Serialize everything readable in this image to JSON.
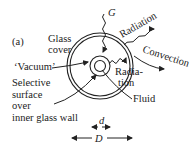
{
  "figure": {
    "panel_label": "(a)",
    "labels": {
      "G": "G",
      "radiation_out": "Radiation",
      "convection": "Convection",
      "glass_cover_1": "Glass",
      "glass_cover_2": "cover",
      "vacuum": "‘Vacuum’",
      "selective_1": "Selective",
      "selective_2": "surface",
      "selective_3": "over",
      "selective_4": "inner glass wall",
      "radiation_in_1": "Radia-",
      "radiation_in_2": "tion",
      "fluid": "Fluid",
      "d": "d",
      "D": "D"
    },
    "colors": {
      "ink": "#222222",
      "background": "#ffffff"
    }
  }
}
